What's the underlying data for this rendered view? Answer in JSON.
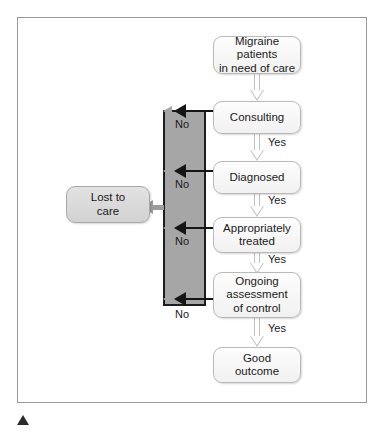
{
  "figure": {
    "frame_border_color": "#9a9a9a",
    "decision_column_color": "#a6a6a6",
    "node_fill_color": "#f4f4f4",
    "lost_node_fill_color": "#d9d9d9",
    "marker_color": "#2b2b2b"
  },
  "nodes": {
    "start": "Migraine patients\nin need of care",
    "start_line1": "Migraine patients",
    "start_line2": "in need of care",
    "consulting": "Consulting",
    "diagnosed": "Diagnosed",
    "treated_line1": "Appropriately",
    "treated_line2": "treated",
    "ongoing_line1": "Ongoing",
    "ongoing_line2": "assessment",
    "ongoing_line3": "of control",
    "outcome_line1": "Good",
    "outcome_line2": "outcome",
    "lost_line1": "Lost to",
    "lost_line2": "care"
  },
  "edges": {
    "yes_1": "Yes",
    "yes_2": "Yes",
    "yes_3": "Yes",
    "yes_4": "Yes",
    "no_1": "No",
    "no_2": "No",
    "no_3": "No",
    "no_4": "No"
  }
}
